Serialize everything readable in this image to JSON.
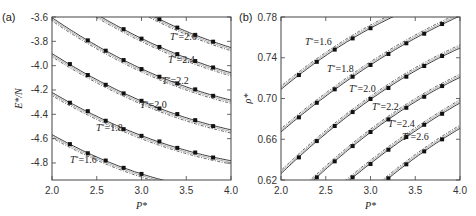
{
  "chart_data": [
    {
      "type": "line",
      "panel": "(a)",
      "xlabel": "P*",
      "ylabel": "E*/N",
      "xlim": [
        2.0,
        4.0
      ],
      "ylim": [
        -4.94,
        -3.6
      ],
      "xticks": [
        "2.0",
        "2.5",
        "3.0",
        "3.5",
        "4.0"
      ],
      "yticks": [
        "-3.6",
        "-3.8",
        "-4.0",
        "-4.2",
        "-4.4",
        "-4.6",
        "-4.8"
      ],
      "grid": false,
      "legend": "inline labels",
      "series": [
        {
          "name": "T*=1.6",
          "label": "T*=1.6",
          "x": [
            2.2,
            2.4,
            2.6,
            2.8,
            3.0
          ],
          "values": [
            -4.645,
            -4.72,
            -4.78,
            -4.84,
            -4.89
          ]
        },
        {
          "name": "T*=1.8",
          "label": "T*=1.8",
          "x": [
            2.2,
            2.4,
            2.6,
            2.8,
            3.0,
            3.2,
            3.4,
            3.6,
            3.8
          ],
          "values": [
            -4.305,
            -4.374,
            -4.453,
            -4.522,
            -4.577,
            -4.623,
            -4.676,
            -4.714,
            -4.755
          ]
        },
        {
          "name": "T*=2.0",
          "label": "T*=2.0",
          "x": [
            2.2,
            2.4,
            2.6,
            2.8,
            3.0,
            3.2,
            3.4,
            3.6,
            3.8
          ],
          "values": [
            -3.987,
            -4.077,
            -4.157,
            -4.228,
            -4.289,
            -4.352,
            -4.398,
            -4.448,
            -4.497
          ]
        },
        {
          "name": "T*=2.2",
          "label": "T*=2.2",
          "x": [
            2.4,
            2.6,
            2.8,
            3.0,
            3.2,
            3.4,
            3.6,
            3.8
          ],
          "values": [
            -3.792,
            -3.877,
            -3.954,
            -4.028,
            -4.091,
            -4.146,
            -4.195,
            -4.248
          ]
        },
        {
          "name": "T*=2.4",
          "label": "T*=2.4",
          "x": [
            2.8,
            3.0,
            3.2,
            3.4,
            3.6,
            3.8
          ],
          "values": [
            -3.7,
            -3.778,
            -3.846,
            -3.905,
            -3.962,
            -4.015
          ]
        },
        {
          "name": "T*=2.6",
          "label": "T*=2.6",
          "x": [
            3.2,
            3.4,
            3.6,
            3.8
          ],
          "values": [
            -3.618,
            -3.687,
            -3.747,
            -3.803
          ]
        }
      ]
    },
    {
      "type": "line",
      "panel": "(b)",
      "xlabel": "P*",
      "ylabel": "ρ*",
      "xlim": [
        2.0,
        4.0
      ],
      "ylim": [
        0.62,
        0.78
      ],
      "xticks": [
        "2.0",
        "2.5",
        "3.0",
        "3.5",
        "4.0"
      ],
      "yticks": [
        "0.78",
        "0.74",
        "0.70",
        "0.66",
        "0.62"
      ],
      "grid": false,
      "legend": "inline labels",
      "series": [
        {
          "name": "T*=1.6",
          "label": "T*=1.6",
          "x": [
            2.2,
            2.4,
            2.6,
            2.8,
            3.0
          ],
          "values": [
            0.723,
            0.736,
            0.748,
            0.759,
            0.769
          ]
        },
        {
          "name": "T*=1.8",
          "label": "T*=1.8",
          "x": [
            2.2,
            2.4,
            2.6,
            2.8,
            3.0,
            3.2,
            3.4,
            3.6,
            3.8
          ],
          "values": [
            0.6815,
            0.6958,
            0.709,
            0.7214,
            0.7329,
            0.7437,
            0.7542,
            0.7636,
            0.7731
          ]
        },
        {
          "name": "T*=2.0",
          "label": "T*=2.0",
          "x": [
            2.2,
            2.4,
            2.6,
            2.8,
            3.0,
            3.2,
            3.4,
            3.6,
            3.8
          ],
          "values": [
            0.6422,
            0.6582,
            0.673,
            0.6867,
            0.6995,
            0.7103,
            0.7214,
            0.7319,
            0.7417
          ]
        },
        {
          "name": "T*=2.2",
          "label": "T*=2.2",
          "x": [
            2.4,
            2.6,
            2.8,
            3.0,
            3.2,
            3.4,
            3.6,
            3.8
          ],
          "values": [
            0.6226,
            0.6383,
            0.6533,
            0.6671,
            0.6795,
            0.6909,
            0.7017,
            0.7122
          ]
        },
        {
          "name": "T*=2.4",
          "label": "T*=2.4",
          "x": [
            2.8,
            3.0,
            3.2,
            3.4,
            3.6,
            3.8
          ],
          "values": [
            0.6226,
            0.6357,
            0.6497,
            0.6622,
            0.6742,
            0.685
          ]
        },
        {
          "name": "T*=2.6",
          "label": "T*=2.6",
          "x": [
            3.2,
            3.4,
            3.6,
            3.8
          ],
          "values": [
            0.6216,
            0.6354,
            0.6481,
            0.6599
          ]
        }
      ]
    }
  ],
  "layout": {
    "panels": [
      {
        "left": 52,
        "right": 231,
        "top": 17,
        "bottom": 180,
        "label_pos": [
          [
            18,
            163
          ],
          [
            44,
            131
          ],
          [
            88,
            108
          ],
          [
            110,
            84
          ],
          [
            116,
            63
          ],
          [
            118,
            40
          ]
        ],
        "line_offset": 3.2
      },
      {
        "left": 281,
        "right": 460,
        "top": 17,
        "bottom": 180,
        "label_pos": [
          [
            305,
            45
          ],
          [
            327,
            72
          ],
          [
            349,
            92
          ],
          [
            372,
            110
          ],
          [
            388,
            127
          ],
          [
            402,
            140
          ]
        ],
        "line_offset": -3.2
      }
    ],
    "colors": {
      "line": "#222222",
      "marker": "#111111",
      "frame": "#444444",
      "text": "#333333"
    }
  }
}
